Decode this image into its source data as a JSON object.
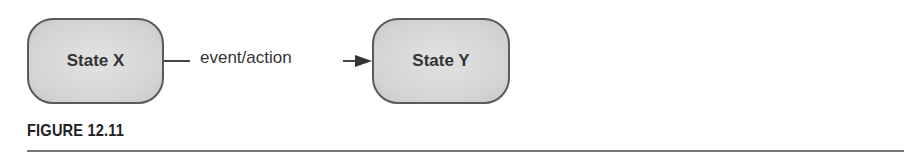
{
  "diagram": {
    "states": [
      {
        "id": "state-x",
        "label": "State X"
      },
      {
        "id": "state-y",
        "label": "State Y"
      }
    ],
    "transition": {
      "from": "State X",
      "to": "State Y",
      "label": "event/action"
    }
  },
  "caption": "FIGURE 12.11",
  "colors": {
    "state_fill": "#d6d6d6",
    "stroke": "#444444",
    "text": "#333333"
  }
}
